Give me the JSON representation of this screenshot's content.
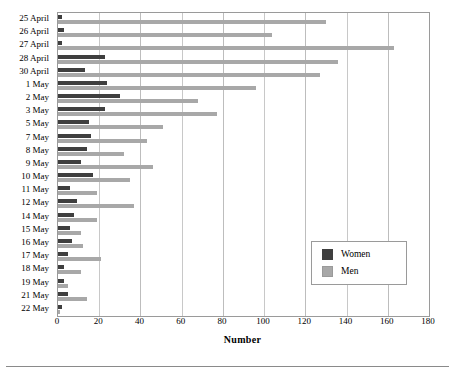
{
  "chart_data": {
    "type": "bar",
    "orientation": "horizontal",
    "title": "",
    "xlabel": "Number",
    "ylabel": "",
    "xlim": [
      0,
      180
    ],
    "xticks": [
      0,
      20,
      40,
      60,
      80,
      100,
      120,
      140,
      160,
      180
    ],
    "grid": true,
    "legend_position": "center-right",
    "categories": [
      "25 April",
      "26 April",
      "27 April",
      "28 April",
      "30 April",
      "1 May",
      "2 May",
      "3 May",
      "5 May",
      "7 May",
      "8 May",
      "9 May",
      "10 May",
      "11 May",
      "12 May",
      "14 May",
      "15 May",
      "16 May",
      "17 May",
      "18 May",
      "19 May",
      "21 May",
      "22 May"
    ],
    "series": [
      {
        "name": "Women",
        "color": "#3f3f3f",
        "values": [
          2,
          3,
          2,
          23,
          13,
          24,
          30,
          23,
          15,
          16,
          14,
          11,
          17,
          6,
          9,
          8,
          6,
          7,
          5,
          3,
          3,
          5,
          2
        ]
      },
      {
        "name": "Men",
        "color": "#a8a8a8",
        "values": [
          130,
          104,
          163,
          136,
          127,
          96,
          68,
          77,
          51,
          43,
          32,
          46,
          35,
          19,
          37,
          19,
          11,
          12,
          21,
          11,
          5,
          14,
          1
        ]
      }
    ]
  },
  "legend": {
    "items": [
      {
        "label": "Women",
        "swatch": "women"
      },
      {
        "label": "Men",
        "swatch": "men"
      }
    ]
  }
}
